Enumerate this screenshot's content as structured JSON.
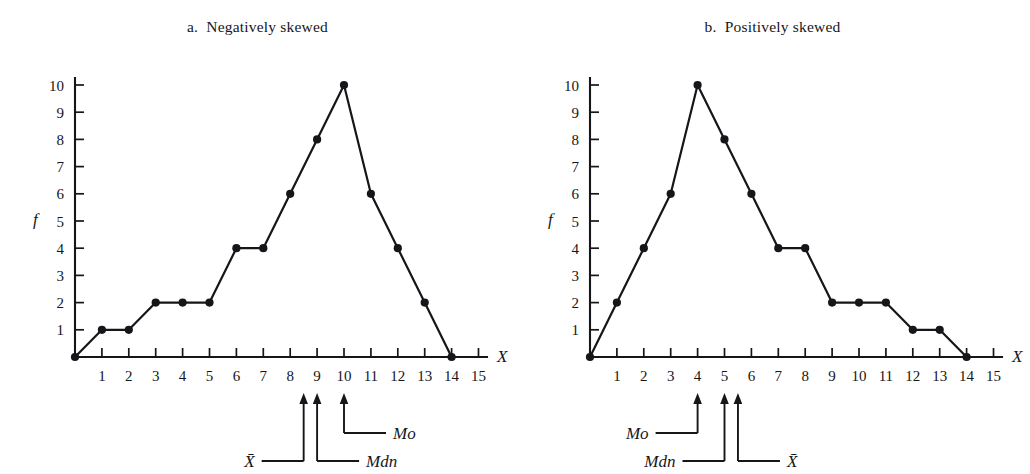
{
  "figure": {
    "background_color": "#ffffff",
    "ink_color": "#16161a"
  },
  "panels": [
    {
      "key": "a",
      "title": "a.  Negatively skewed",
      "x_axis_label": "X",
      "y_axis_label": "f",
      "annotations": [
        {
          "name": "mean",
          "label": "X̄",
          "x_value": 8.5
        },
        {
          "name": "median",
          "label": "Mdn",
          "x_value": 9
        },
        {
          "name": "mode",
          "label": "Mo",
          "x_value": 10
        }
      ]
    },
    {
      "key": "b",
      "title": "b.  Positively skewed",
      "x_axis_label": "X",
      "y_axis_label": "f",
      "annotations": [
        {
          "name": "mode",
          "label": "Mo",
          "x_value": 4
        },
        {
          "name": "median",
          "label": "Mdn",
          "x_value": 5
        },
        {
          "name": "mean",
          "label": "X̄",
          "x_value": 5.5
        }
      ]
    }
  ],
  "chart_data": [
    {
      "type": "line",
      "title": "a.  Negatively skewed",
      "xlabel": "X",
      "ylabel": "f",
      "xlim": [
        0,
        15
      ],
      "ylim": [
        0,
        10
      ],
      "xticks": [
        0,
        1,
        2,
        3,
        4,
        5,
        6,
        7,
        8,
        9,
        10,
        11,
        12,
        13,
        14,
        15
      ],
      "xtick_labels": [
        "",
        "1",
        "2",
        "3",
        "4",
        "5",
        "6",
        "7",
        "8",
        "9",
        "10",
        "11",
        "12",
        "13",
        "14",
        "15"
      ],
      "yticks": [
        1,
        2,
        3,
        4,
        5,
        6,
        7,
        8,
        9,
        10
      ],
      "ytick_labels": [
        "1",
        "2",
        "3",
        "4",
        "5",
        "6",
        "7",
        "8",
        "9",
        "10"
      ],
      "grid": false,
      "legend": "none",
      "markers": true,
      "x": [
        0,
        1,
        2,
        3,
        4,
        5,
        6,
        7,
        8,
        9,
        10,
        11,
        12,
        13,
        14
      ],
      "values": [
        0,
        1,
        1,
        2,
        2,
        2,
        4,
        4,
        6,
        8,
        10,
        6,
        4,
        2,
        0
      ],
      "annotations": [
        {
          "label": "X̄",
          "x": 8.5
        },
        {
          "label": "Mdn",
          "x": 9
        },
        {
          "label": "Mo",
          "x": 10
        }
      ]
    },
    {
      "type": "line",
      "title": "b.  Positively skewed",
      "xlabel": "X",
      "ylabel": "f",
      "xlim": [
        0,
        15
      ],
      "ylim": [
        0,
        10
      ],
      "xticks": [
        0,
        1,
        2,
        3,
        4,
        5,
        6,
        7,
        8,
        9,
        10,
        11,
        12,
        13,
        14,
        15
      ],
      "xtick_labels": [
        "",
        "1",
        "2",
        "3",
        "4",
        "5",
        "6",
        "7",
        "8",
        "9",
        "10",
        "11",
        "12",
        "13",
        "14",
        "15"
      ],
      "yticks": [
        1,
        2,
        3,
        4,
        5,
        6,
        7,
        8,
        9,
        10
      ],
      "ytick_labels": [
        "1",
        "2",
        "3",
        "4",
        "5",
        "6",
        "7",
        "8",
        "9",
        "10"
      ],
      "grid": false,
      "legend": "none",
      "markers": true,
      "x": [
        0,
        1,
        2,
        3,
        4,
        5,
        6,
        7,
        8,
        9,
        10,
        11,
        12,
        13,
        14
      ],
      "values": [
        0,
        2,
        4,
        6,
        10,
        8,
        6,
        4,
        4,
        2,
        2,
        2,
        1,
        1,
        0
      ],
      "annotations": [
        {
          "label": "Mo",
          "x": 4
        },
        {
          "label": "Mdn",
          "x": 5
        },
        {
          "label": "X̄",
          "x": 5.5
        }
      ]
    }
  ]
}
